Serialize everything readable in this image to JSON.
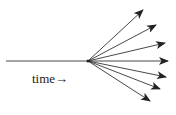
{
  "diagram": {
    "label": "time→",
    "line_color": "#333333",
    "origin": [
      88,
      61
    ],
    "trunk_start": [
      6,
      61
    ],
    "arrows": [
      {
        "tip": [
          143,
          10
        ]
      },
      {
        "tip": [
          156,
          25
        ]
      },
      {
        "tip": [
          165,
          43
        ]
      },
      {
        "tip": [
          168,
          61
        ]
      },
      {
        "tip": [
          166,
          77
        ]
      },
      {
        "tip": [
          160,
          89
        ]
      },
      {
        "tip": [
          150,
          101
        ]
      }
    ]
  }
}
